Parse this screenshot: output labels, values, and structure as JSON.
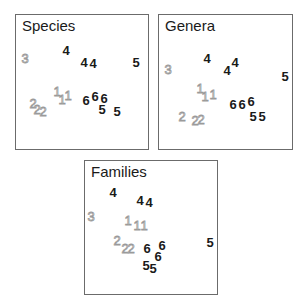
{
  "colors": {
    "dark_label": "#1a1a1a",
    "light_label_outline": "#9a9a9a",
    "frame": "#6b6b6b"
  },
  "panels": [
    {
      "title": "Species",
      "box": {
        "left": 15,
        "top": 14,
        "width": 134,
        "height": 136
      },
      "points": [
        {
          "label": "3",
          "x": 25,
          "y": 58,
          "style": "light"
        },
        {
          "label": "4",
          "x": 66,
          "y": 50,
          "style": "dark"
        },
        {
          "label": "4",
          "x": 84,
          "y": 62,
          "style": "dark"
        },
        {
          "label": "4",
          "x": 93,
          "y": 63,
          "style": "dark"
        },
        {
          "label": "5",
          "x": 136,
          "y": 62,
          "style": "dark"
        },
        {
          "label": "1",
          "x": 57,
          "y": 91,
          "style": "light"
        },
        {
          "label": "1",
          "x": 62,
          "y": 99,
          "style": "light"
        },
        {
          "label": "1",
          "x": 68,
          "y": 95,
          "style": "light"
        },
        {
          "label": "6",
          "x": 86,
          "y": 100,
          "style": "dark"
        },
        {
          "label": "6",
          "x": 95,
          "y": 96,
          "style": "dark"
        },
        {
          "label": "6",
          "x": 104,
          "y": 98,
          "style": "dark"
        },
        {
          "label": "5",
          "x": 102,
          "y": 109,
          "style": "dark"
        },
        {
          "label": "5",
          "x": 117,
          "y": 111,
          "style": "dark"
        },
        {
          "label": "2",
          "x": 33,
          "y": 103,
          "style": "light"
        },
        {
          "label": "2",
          "x": 37,
          "y": 109,
          "style": "light"
        },
        {
          "label": "2",
          "x": 43,
          "y": 111,
          "style": "light"
        }
      ]
    },
    {
      "title": "Genera",
      "box": {
        "left": 158,
        "top": 14,
        "width": 135,
        "height": 136
      },
      "points": [
        {
          "label": "3",
          "x": 168,
          "y": 69,
          "style": "light"
        },
        {
          "label": "4",
          "x": 207,
          "y": 58,
          "style": "dark"
        },
        {
          "label": "4",
          "x": 227,
          "y": 70,
          "style": "dark"
        },
        {
          "label": "4",
          "x": 235,
          "y": 62,
          "style": "dark"
        },
        {
          "label": "5",
          "x": 285,
          "y": 76,
          "style": "dark"
        },
        {
          "label": "1",
          "x": 200,
          "y": 88,
          "style": "light"
        },
        {
          "label": "1",
          "x": 205,
          "y": 96,
          "style": "light"
        },
        {
          "label": "1",
          "x": 213,
          "y": 94,
          "style": "light"
        },
        {
          "label": "6",
          "x": 233,
          "y": 104,
          "style": "dark"
        },
        {
          "label": "6",
          "x": 242,
          "y": 104,
          "style": "dark"
        },
        {
          "label": "6",
          "x": 251,
          "y": 101,
          "style": "dark"
        },
        {
          "label": "5",
          "x": 253,
          "y": 116,
          "style": "dark"
        },
        {
          "label": "5",
          "x": 262,
          "y": 116,
          "style": "dark"
        },
        {
          "label": "2",
          "x": 182,
          "y": 116,
          "style": "light"
        },
        {
          "label": "2",
          "x": 195,
          "y": 120,
          "style": "light"
        },
        {
          "label": "2",
          "x": 201,
          "y": 119,
          "style": "light"
        }
      ]
    },
    {
      "title": "Families",
      "box": {
        "left": 84,
        "top": 160,
        "width": 134,
        "height": 135
      },
      "points": [
        {
          "label": "4",
          "x": 113,
          "y": 192,
          "style": "dark"
        },
        {
          "label": "4",
          "x": 140,
          "y": 200,
          "style": "dark"
        },
        {
          "label": "4",
          "x": 149,
          "y": 202,
          "style": "dark"
        },
        {
          "label": "3",
          "x": 91,
          "y": 216,
          "style": "light"
        },
        {
          "label": "1",
          "x": 128,
          "y": 220,
          "style": "light"
        },
        {
          "label": "1",
          "x": 137,
          "y": 225,
          "style": "light"
        },
        {
          "label": "1",
          "x": 144,
          "y": 225,
          "style": "light"
        },
        {
          "label": "2",
          "x": 117,
          "y": 240,
          "style": "light"
        },
        {
          "label": "2",
          "x": 125,
          "y": 248,
          "style": "light"
        },
        {
          "label": "2",
          "x": 131,
          "y": 248,
          "style": "light"
        },
        {
          "label": "6",
          "x": 147,
          "y": 248,
          "style": "dark"
        },
        {
          "label": "6",
          "x": 162,
          "y": 245,
          "style": "dark"
        },
        {
          "label": "6",
          "x": 158,
          "y": 256,
          "style": "dark"
        },
        {
          "label": "5",
          "x": 210,
          "y": 242,
          "style": "dark"
        },
        {
          "label": "5",
          "x": 146,
          "y": 265,
          "style": "dark"
        },
        {
          "label": "5",
          "x": 153,
          "y": 268,
          "style": "dark"
        }
      ]
    }
  ]
}
